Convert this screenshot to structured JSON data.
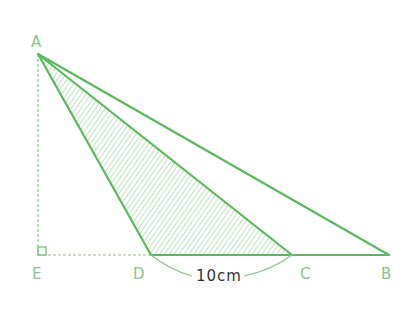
{
  "diagram": {
    "type": "geometry-triangles",
    "colors": {
      "line": "#5cb85c",
      "hatch": "#7fc47f",
      "dashed": "#8cc48c",
      "label": "#8cc48c",
      "measure_text": "#333333"
    },
    "points": {
      "A": {
        "label": "A",
        "x": 38,
        "y": 54
      },
      "E": {
        "label": "E",
        "x": 38,
        "y": 255
      },
      "D": {
        "label": "D",
        "x": 151,
        "y": 255
      },
      "C": {
        "label": "C",
        "x": 292,
        "y": 255
      },
      "B": {
        "label": "B",
        "x": 389,
        "y": 255
      }
    },
    "triangles": [
      {
        "name": "ABD",
        "vertices": [
          "A",
          "B",
          "D"
        ],
        "shaded": false
      },
      {
        "name": "ACD",
        "vertices": [
          "A",
          "C",
          "D"
        ],
        "shaded": true,
        "fill": "hatched"
      }
    ],
    "dashed_lines": [
      {
        "from": "A",
        "to": "E"
      },
      {
        "from": "E",
        "to": "D"
      }
    ],
    "right_angle": {
      "at": "E"
    },
    "measurement": {
      "segment": "DC",
      "text": "10cm"
    }
  }
}
